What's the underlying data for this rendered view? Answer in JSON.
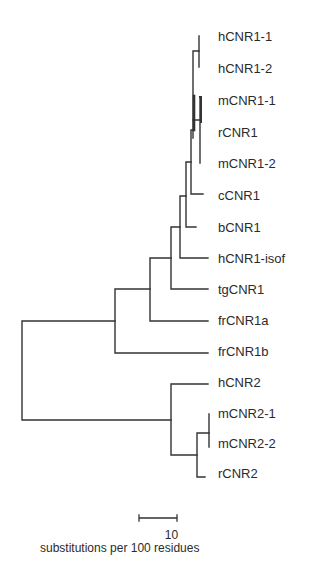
{
  "figure": {
    "type": "phylogenetic-tree",
    "leaves": [
      {
        "label": "hCNR1-1",
        "y": 40
      },
      {
        "label": "hCNR1-2",
        "y": 71
      },
      {
        "label": "mCNR1-1",
        "y": 103
      },
      {
        "label": "rCNR1",
        "y": 135
      },
      {
        "label": "mCNR1-2",
        "y": 166
      },
      {
        "label": "cCNR1",
        "y": 198
      },
      {
        "label": "bCNR1",
        "y": 230
      },
      {
        "label": "hCNR1-isof",
        "y": 262
      },
      {
        "label": "tgCNR1",
        "y": 293
      },
      {
        "label": "frCNR1a",
        "y": 324
      },
      {
        "label": "frCNR1b",
        "y": 355
      },
      {
        "label": "hCNR2",
        "y": 386
      },
      {
        "label": "mCNR2-1",
        "y": 416
      },
      {
        "label": "mCNR2-2",
        "y": 446
      },
      {
        "label": "rCNR2",
        "y": 476
      }
    ],
    "scale_bar": {
      "value": "10",
      "caption": "substitutions per 100 residues"
    },
    "line_color": "#333333"
  }
}
